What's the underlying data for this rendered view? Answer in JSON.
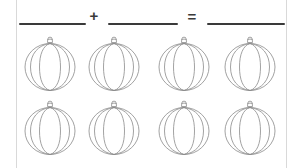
{
  "worksheet": {
    "background_color": "#ffffff",
    "page_edge_color": "#d9d9d9",
    "line_color": "#3a3a3a",
    "pumpkin_outline_color": "#8a8a8a"
  },
  "equation": {
    "addend_1_blank": "",
    "plus_symbol": "+",
    "addend_2_blank": "",
    "equals_symbol": "=",
    "sum_blank": ""
  },
  "pumpkin_grid": {
    "rows": [
      {
        "row_label": "row-1",
        "pumpkins": [
          {
            "name": "pumpkin-1"
          },
          {
            "name": "pumpkin-2"
          },
          {
            "name": "pumpkin-3"
          },
          {
            "name": "pumpkin-4"
          }
        ]
      },
      {
        "row_label": "row-2",
        "pumpkins": [
          {
            "name": "pumpkin-5"
          },
          {
            "name": "pumpkin-6"
          },
          {
            "name": "pumpkin-7"
          },
          {
            "name": "pumpkin-8"
          }
        ]
      }
    ],
    "total_count": 8,
    "per_row_count": 4
  }
}
